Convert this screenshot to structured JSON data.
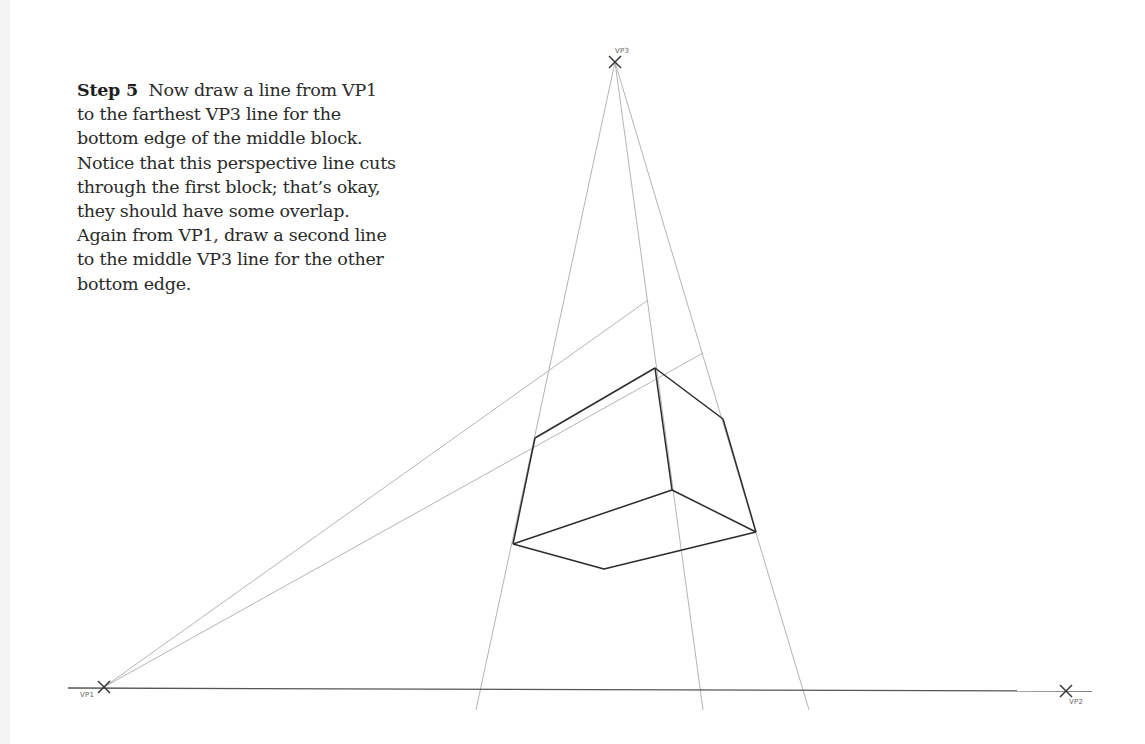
{
  "instructions": {
    "step_label": "Step 5",
    "lines": [
      "Now draw a line from VP1",
      "to the farthest VP3 line for the",
      "bottom edge of the middle block.",
      "Notice that this perspective line cuts",
      "through the first block; that’s okay,",
      "they should have some overlap.",
      "Again from VP1, draw a second line",
      "to the middle VP3 line for the other",
      "bottom edge."
    ]
  },
  "diagram": {
    "vanishing_points": {
      "vp1": {
        "label": "VP1",
        "x": 104,
        "y": 687
      },
      "vp2": {
        "label": "VP2",
        "x": 1066,
        "y": 691
      },
      "vp3": {
        "label": "VP3",
        "x": 615,
        "y": 62
      }
    },
    "colors": {
      "horizon": "#555555",
      "guide": "#b4b4b4",
      "block_edge": "#2b2b2b",
      "marker": "#333333",
      "text": "#2a2a2a"
    }
  }
}
